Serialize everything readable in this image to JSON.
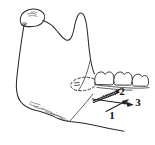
{
  "figure": {
    "title": "Lateral view line drawing of the mandible with molar teeth and directional arrows",
    "background_color": "#ffffff",
    "line_color": "#2b2b2b",
    "width": 155,
    "height": 145
  },
  "structures": {
    "condyle": "condylar-head",
    "sigmoid_notch": "mandibular-notch",
    "coronoid": "coronoid-process",
    "ramus": "mandibular-ramus",
    "angle": "gonial-angle",
    "body": "mandibular-body",
    "antegonial_notch": "antegonial-notch",
    "teeth_label": "molar-teeth",
    "dashed_region_label": "dashed-ellipse-region"
  },
  "labels": [
    {
      "id": "label-1",
      "text": "1",
      "x": 112,
      "y": 116
    },
    {
      "id": "label-2",
      "text": "2",
      "x": 122,
      "y": 92
    },
    {
      "id": "label-3",
      "text": "3",
      "x": 138,
      "y": 103
    }
  ],
  "teeth": [
    {
      "id": "tooth-1",
      "name": "first-molar"
    },
    {
      "id": "tooth-2",
      "name": "second-molar"
    },
    {
      "id": "tooth-3",
      "name": "third-molar"
    }
  ],
  "arrows": [
    {
      "id": "arrow-1",
      "name": "solid-arrow-lower",
      "points_to": "1"
    },
    {
      "id": "arrow-2",
      "name": "hatched-arrow-upper",
      "points_to": "2"
    },
    {
      "id": "arrow-3",
      "name": "solid-arrow-right",
      "points_to": "3"
    }
  ]
}
